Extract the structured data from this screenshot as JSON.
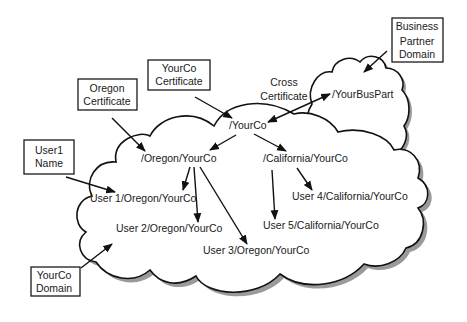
{
  "diagram": {
    "title": "",
    "label_boxes": {
      "yourco_certificate": [
        "YourCo",
        "Certificate"
      ],
      "oregon_certificate": [
        "Oregon",
        "Certificate"
      ],
      "user1_name": [
        "User1",
        "Name"
      ],
      "yourco_domain": [
        "YourCo",
        "Domain"
      ],
      "business_partner_domain": [
        "Business",
        "Partner",
        "Domain"
      ]
    },
    "cross_certificate_label": [
      "Cross",
      "Certificate"
    ],
    "nodes": {
      "root": "/YourCo",
      "oregon": "/Oregon/YourCo",
      "california": "/California/YourCo",
      "user1": "User 1/Oregon/YourCo",
      "user2": "User 2/Oregon/YourCo",
      "user3": "User 3/Oregon/YourCo",
      "user4": "User 4/California/YourCo",
      "user5": "User 5/California/YourCo",
      "buspart": "/YourBusPart"
    },
    "edges": [
      {
        "from": "/YourCo",
        "to": "/Oregon/YourCo"
      },
      {
        "from": "/YourCo",
        "to": "/California/YourCo"
      },
      {
        "from": "/Oregon/YourCo",
        "to": "User 1/Oregon/YourCo"
      },
      {
        "from": "/Oregon/YourCo",
        "to": "User 2/Oregon/YourCo"
      },
      {
        "from": "/Oregon/YourCo",
        "to": "User 3/Oregon/YourCo"
      },
      {
        "from": "/California/YourCo",
        "to": "User 4/California/YourCo"
      },
      {
        "from": "/California/YourCo",
        "to": "User 5/California/YourCo"
      },
      {
        "from": "/YourCo",
        "to": "/YourBusPart",
        "bidirectional": true,
        "label": "Cross Certificate"
      }
    ],
    "callouts": [
      {
        "label": "YourCo Certificate",
        "points_to": "/YourCo"
      },
      {
        "label": "Oregon Certificate",
        "points_to": "/Oregon/YourCo"
      },
      {
        "label": "User1 Name",
        "points_to": "User 1/Oregon/YourCo"
      },
      {
        "label": "YourCo Domain",
        "points_to": "YourCo domain cloud"
      },
      {
        "label": "Business Partner Domain",
        "points_to": "Business partner cloud"
      }
    ]
  }
}
